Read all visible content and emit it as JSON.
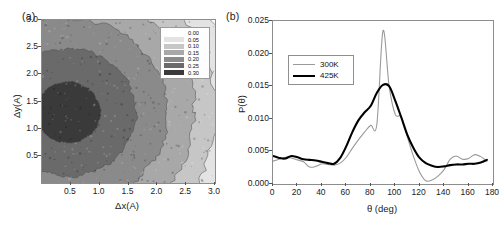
{
  "figure": {
    "panel_a_label": "(a)",
    "panel_b_label": "(b)"
  },
  "chart_data": [
    {
      "type": "heatmap",
      "panel": "(a)",
      "title": "",
      "xlabel": "Δx(A)",
      "ylabel": "Δy(A)",
      "xlim": [
        0.0,
        3.0
      ],
      "ylim": [
        0.0,
        3.0
      ],
      "xticks": [
        0.5,
        1.0,
        1.5,
        2.0,
        2.5,
        3.0
      ],
      "xtick_labels": [
        "0.5",
        "1.0",
        "1.5",
        "2.0",
        "2.5",
        "3.0"
      ],
      "yticks": [
        0.5,
        1.0,
        1.5,
        2.0,
        2.5,
        3.0
      ],
      "ytick_labels": [
        "0.5",
        "1.0",
        "1.5",
        "2.0",
        "2.5",
        "3.0"
      ],
      "grid": false,
      "colorbar_style": "discrete-filled-contour-legend",
      "legend_position": "inside-top-right",
      "levels": [
        0.0,
        0.05,
        0.1,
        0.15,
        0.2,
        0.25,
        0.3
      ],
      "level_labels": [
        "0.00",
        "0.05",
        "0.10",
        "0.15",
        "0.20",
        "0.25",
        "0.30"
      ],
      "level_colors": [
        "#fbfbfb",
        "#e3e3e3",
        "#c6c6c6",
        "#a8a8a8",
        "#8a8a8a",
        "#6a6a6a",
        "#3a3a3a"
      ],
      "description": "Filled contour map of probability density; concentric arc-shaped bands decreasing outward from a dark core near the lower-left.",
      "core_center": [
        0.45,
        1.3
      ],
      "contour_radii": [
        2.95,
        2.55,
        2.15,
        1.7,
        1.15,
        0.55
      ]
    },
    {
      "type": "line",
      "panel": "(b)",
      "title": "",
      "xlabel": "θ (deg)",
      "ylabel": "P(θ)",
      "xlim": [
        0,
        180
      ],
      "ylim": [
        0.0,
        0.025
      ],
      "xticks": [
        0,
        20,
        40,
        60,
        80,
        100,
        120,
        140,
        160,
        180
      ],
      "xtick_labels": [
        "0",
        "20",
        "40",
        "60",
        "80",
        "100",
        "120",
        "140",
        "160",
        "180"
      ],
      "yticks": [
        0.0,
        0.005,
        0.01,
        0.015,
        0.02,
        0.025
      ],
      "ytick_labels": [
        "0.000",
        "0.005",
        "0.010",
        "0.015",
        "0.020",
        "0.025"
      ],
      "grid": false,
      "legend_position": "upper-left-inside",
      "x": [
        0,
        5,
        10,
        15,
        20,
        25,
        30,
        35,
        40,
        45,
        50,
        55,
        60,
        65,
        70,
        75,
        80,
        85,
        90,
        95,
        100,
        105,
        110,
        115,
        120,
        125,
        130,
        135,
        140,
        145,
        150,
        155,
        160,
        165,
        170,
        175
      ],
      "series": [
        {
          "name": "300K",
          "color": "#9a9a9a",
          "width": 1.1,
          "values": [
            0.0035,
            0.0038,
            0.0041,
            0.004,
            0.0037,
            0.0034,
            0.0026,
            0.0027,
            0.0031,
            0.003,
            0.0029,
            0.0032,
            0.0041,
            0.0055,
            0.0068,
            0.008,
            0.009,
            0.0092,
            0.0235,
            0.015,
            0.0107,
            0.0103,
            0.0072,
            0.0042,
            0.0018,
            0.0005,
            0.0006,
            0.0012,
            0.0022,
            0.0038,
            0.0043,
            0.0038,
            0.0039,
            0.0045,
            0.0042,
            0.0035
          ]
        },
        {
          "name": "425K",
          "color": "#000000",
          "width": 2.1,
          "values": [
            0.0043,
            0.004,
            0.0039,
            0.0043,
            0.0041,
            0.0038,
            0.0037,
            0.0036,
            0.0034,
            0.0032,
            0.0031,
            0.004,
            0.0058,
            0.008,
            0.0098,
            0.011,
            0.012,
            0.014,
            0.0152,
            0.015,
            0.0128,
            0.0102,
            0.0075,
            0.0055,
            0.004,
            0.0032,
            0.0028,
            0.0026,
            0.0027,
            0.0029,
            0.003,
            0.003,
            0.0031,
            0.0031,
            0.0033,
            0.0037
          ]
        }
      ]
    }
  ]
}
